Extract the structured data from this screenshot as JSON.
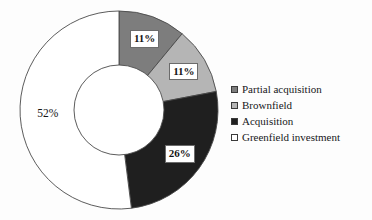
{
  "chart_data": {
    "type": "pie",
    "variant": "donut",
    "title": "",
    "subtitle": "",
    "xlabel": "",
    "ylabel": "",
    "categories": [
      "Partial acquisition",
      "Brownfield",
      "Acquisition",
      "Greenfield investment"
    ],
    "values": [
      11,
      11,
      26,
      52
    ],
    "value_unit": "%",
    "data_labels": [
      "11%",
      "11%",
      "26%",
      "52%"
    ],
    "colors": [
      "#7d7d7d",
      "#b5b5b5",
      "#1f1f1f",
      "#ffffff"
    ],
    "slice_border_color": "#4a4a4a",
    "start_angle_deg": 0,
    "direction": "clockwise",
    "inner_radius_ratio": 0.455,
    "grid": false,
    "legend": {
      "position": "right",
      "entries": [
        {
          "label": "Partial acquisition",
          "color": "#7d7d7d"
        },
        {
          "label": "Brownfield",
          "color": "#b5b5b5"
        },
        {
          "label": "Acquisition",
          "color": "#1f1f1f"
        },
        {
          "label": "Greenfield investment",
          "color": "#ffffff"
        }
      ]
    },
    "annotations": []
  },
  "figure": {
    "background": "#fdfdfd",
    "center_x": 119,
    "center_y": 110,
    "outer_radius": 99,
    "inner_radius": 45
  },
  "labels": {
    "partial_acquisition_pct": "11%",
    "brownfield_pct": "11%",
    "acquisition_pct": "26%",
    "greenfield_pct": "52%"
  },
  "legend": {
    "item0": "Partial acquisition",
    "item1": "Brownfield",
    "item2": "Acquisition",
    "item3": "Greenfield investment"
  }
}
